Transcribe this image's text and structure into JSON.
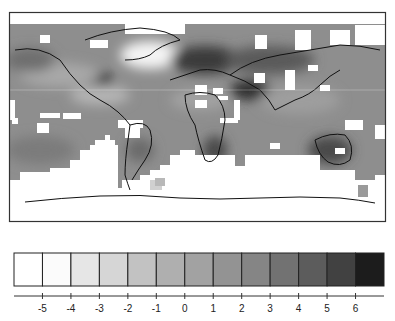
{
  "figure": {
    "type": "gridded-anomaly-world-map",
    "frame": {
      "x": 9,
      "y": 12,
      "width": 377,
      "height": 210
    },
    "colors": {
      "ocean_base": "#8e8e8e",
      "missing": "#ffffff",
      "coastline": "#111111"
    }
  },
  "colorbar": {
    "levels": [
      {
        "color": "#ffffff"
      },
      {
        "color": "#fbfbfb"
      },
      {
        "color": "#e6e6e6"
      },
      {
        "color": "#d6d6d6"
      },
      {
        "color": "#c2c2c2"
      },
      {
        "color": "#afafaf"
      },
      {
        "color": "#a2a2a2"
      },
      {
        "color": "#939393"
      },
      {
        "color": "#858585"
      },
      {
        "color": "#727272"
      },
      {
        "color": "#5c5c5c"
      },
      {
        "color": "#414141"
      },
      {
        "color": "#1c1c1c"
      }
    ],
    "tick_labels": [
      "-5",
      "-4",
      "-3",
      "-2",
      "-1",
      "0",
      "1",
      "2",
      "3",
      "4",
      "5",
      "6"
    ]
  }
}
